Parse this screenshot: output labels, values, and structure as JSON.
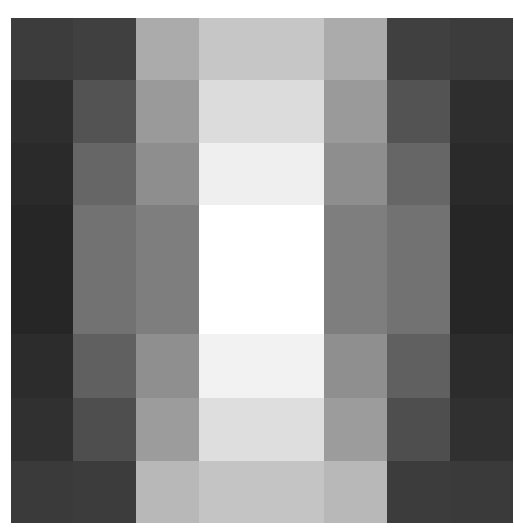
{
  "image": {
    "description": "Symmetric grayscale block pattern: dark outer columns, mid-gray inner columns, white center block",
    "background": "#ffffff",
    "columns_x": [
      11,
      73,
      136,
      199,
      324,
      387,
      450,
      513
    ],
    "rows_y": [
      18,
      80,
      143,
      205,
      334,
      398,
      461,
      523
    ],
    "cells": [
      [
        "#3c3c3c",
        "#404040",
        "#ababab",
        "#c6c6c6",
        "#ababab",
        "#404040",
        "#3c3c3c"
      ],
      [
        "#2e2e2e",
        "#535353",
        "#9a9a9a",
        "#dcdcdc",
        "#9a9a9a",
        "#535353",
        "#2e2e2e"
      ],
      [
        "#2a2a2a",
        "#666666",
        "#8e8e8e",
        "#efefef",
        "#8e8e8e",
        "#666666",
        "#2a2a2a"
      ],
      [
        "#262626",
        "#727272",
        "#7e7e7e",
        "#ffffff",
        "#7e7e7e",
        "#727272",
        "#262626"
      ],
      [
        "#2c2c2c",
        "#606060",
        "#8f8f8f",
        "#f2f2f2",
        "#8f8f8f",
        "#606060",
        "#2c2c2c"
      ],
      [
        "#303030",
        "#4e4e4e",
        "#9c9c9c",
        "#dedede",
        "#9c9c9c",
        "#4e4e4e",
        "#303030"
      ],
      [
        "#3a3a3a",
        "#3c3c3c",
        "#b8b8b8",
        "#c4c4c4",
        "#b8b8b8",
        "#3c3c3c",
        "#3a3a3a"
      ]
    ]
  }
}
